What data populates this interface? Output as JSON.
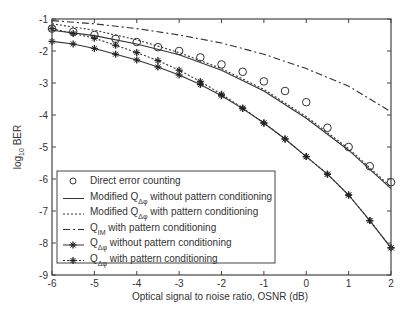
{
  "chart_data": {
    "type": "line",
    "title": "",
    "xlabel": "Optical signal to noise ratio, OSNR (dB)",
    "ylabel": "log10 BER",
    "ylabel_main": "log",
    "ylabel_sub": "10",
    "ylabel_rest": " BER",
    "xlim": [
      -6,
      2
    ],
    "ylim": [
      -9,
      -1
    ],
    "xticks": [
      -6,
      -5,
      -4,
      -3,
      -2,
      -1,
      0,
      1,
      2
    ],
    "yticks": [
      -1,
      -2,
      -3,
      -4,
      -5,
      -6,
      -7,
      -8,
      -9
    ],
    "grid": false,
    "legend_position": "lower-left inside",
    "series": [
      {
        "name": "Direct error counting",
        "style": "markers-circle",
        "x": [
          -6,
          -5.5,
          -5,
          -4.5,
          -4,
          -3.5,
          -3,
          -2.5,
          -2,
          -1.5,
          -1,
          -0.5,
          0,
          0.5,
          1,
          1.5,
          2
        ],
        "values": [
          -1.3,
          -1.4,
          -1.5,
          -1.62,
          -1.72,
          -1.88,
          -2.0,
          -2.2,
          -2.42,
          -2.65,
          -2.95,
          -3.25,
          -3.6,
          -4.4,
          -5.0,
          -5.6,
          -6.1
        ]
      },
      {
        "name": "Modified QΔφ without pattern conditioning",
        "style": "solid",
        "x": [
          -6,
          -5,
          -4,
          -3,
          -2,
          -1,
          0,
          1,
          2
        ],
        "values": [
          -1.35,
          -1.52,
          -1.78,
          -2.12,
          -2.6,
          -3.25,
          -4.1,
          -5.1,
          -6.3
        ]
      },
      {
        "name": "Modified QΔφ with pattern conditioning",
        "style": "dotted",
        "x": [
          -6,
          -5,
          -4,
          -3,
          -2,
          -1,
          0,
          1,
          2
        ],
        "values": [
          -1.15,
          -1.35,
          -1.65,
          -2.05,
          -2.55,
          -3.2,
          -4.05,
          -5.05,
          -6.25
        ]
      },
      {
        "name": "QIM with pattern conditioning",
        "style": "dash-dot",
        "x": [
          -6,
          -5,
          -4,
          -3,
          -2,
          -1,
          0,
          1,
          2
        ],
        "values": [
          -1.05,
          -1.15,
          -1.3,
          -1.5,
          -1.75,
          -2.1,
          -2.55,
          -3.1,
          -3.9
        ]
      },
      {
        "name": "QΔφ without pattern conditioning",
        "style": "solid-star",
        "x": [
          -6,
          -5.5,
          -5,
          -4.5,
          -4,
          -3.5,
          -3,
          -2.5,
          -2,
          -1.5,
          -1,
          -0.5,
          0,
          0.5,
          1,
          1.5,
          2
        ],
        "values": [
          -1.7,
          -1.78,
          -1.92,
          -2.1,
          -2.28,
          -2.5,
          -2.75,
          -3.05,
          -3.4,
          -3.8,
          -4.25,
          -4.75,
          -5.3,
          -5.85,
          -6.5,
          -7.3,
          -8.15
        ]
      },
      {
        "name": "QΔφ with pattern conditioning",
        "style": "dotted-star",
        "x": [
          -6,
          -5.5,
          -5,
          -4.5,
          -4,
          -3.5,
          -3,
          -2.5,
          -2,
          -1.5,
          -1,
          -0.5,
          0,
          0.5,
          1,
          1.5,
          2
        ],
        "values": [
          -1.3,
          -1.45,
          -1.6,
          -1.82,
          -2.05,
          -2.3,
          -2.6,
          -2.95,
          -3.35,
          -3.78,
          -4.25,
          -4.75,
          -5.3,
          -5.85,
          -6.5,
          -7.3,
          -8.15
        ]
      }
    ],
    "legend": [
      {
        "label": "Direct error counting",
        "main": "Direct error counting",
        "sub": "",
        "rest": ""
      },
      {
        "label": "Modified QΔφ without pattern conditioning",
        "main": "Modified Q",
        "sub": "Δφ",
        "rest": " without pattern conditioning"
      },
      {
        "label": "Modified QΔφ with pattern conditioning",
        "main": "Modified Q",
        "sub": "Δφ",
        "rest": " with pattern conditioning"
      },
      {
        "label": "QIM with pattern conditioning",
        "main": "Q",
        "sub": "IM",
        "rest": " with pattern conditioning"
      },
      {
        "label": "QΔφ without pattern conditioning",
        "main": "Q",
        "sub": "Δφ",
        "rest": " without pattern conditioning"
      },
      {
        "label": "QΔφ with pattern conditioning",
        "main": "Q",
        "sub": "Δφ",
        "rest": " with pattern conditioning"
      }
    ]
  }
}
